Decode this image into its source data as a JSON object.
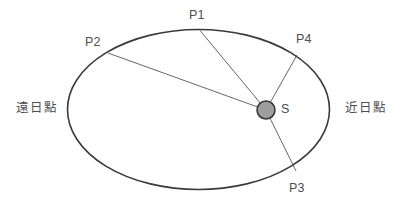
{
  "diagram": {
    "background_color": "#ffffff",
    "orbit": {
      "name": "orbit-ellipse",
      "center_x": 198.5,
      "center_y": 109.5,
      "radius_x": 131,
      "radius_y": 80,
      "stroke_color": "#3a3a3a",
      "stroke_width": 1.6,
      "fill": "none"
    },
    "sun": {
      "label": "S",
      "center_x": 266,
      "center_y": 110,
      "radius": 9,
      "fill_color": "#9e9e9e",
      "stroke_color": "#333333"
    },
    "radius_lines": {
      "stroke_color": "#555555",
      "stroke_width": 0.9,
      "segments": [
        {
          "name": "sun-to-p1",
          "x1": 266,
          "y1": 110,
          "x2": 200,
          "y2": 30.5
        },
        {
          "name": "sun-to-p2",
          "x1": 266,
          "y1": 110,
          "x2": 108,
          "y2": 53
        },
        {
          "name": "sun-to-p3",
          "x1": 266,
          "y1": 110,
          "x2": 296,
          "y2": 171
        },
        {
          "name": "sun-to-p4",
          "x1": 266,
          "y1": 110,
          "x2": 297,
          "y2": 55
        }
      ]
    },
    "points": [
      {
        "id": "p1",
        "label": "P1",
        "x": 189,
        "y": 9
      },
      {
        "id": "p2",
        "label": "P2",
        "x": 85,
        "y": 36
      },
      {
        "id": "p3",
        "label": "P3",
        "x": 289,
        "y": 182
      },
      {
        "id": "p4",
        "label": "P4",
        "x": 296,
        "y": 33
      }
    ],
    "annotations": {
      "aphelion": "遠日點",
      "perihelion": "近日點"
    },
    "text_color": "#4d4d4d"
  }
}
